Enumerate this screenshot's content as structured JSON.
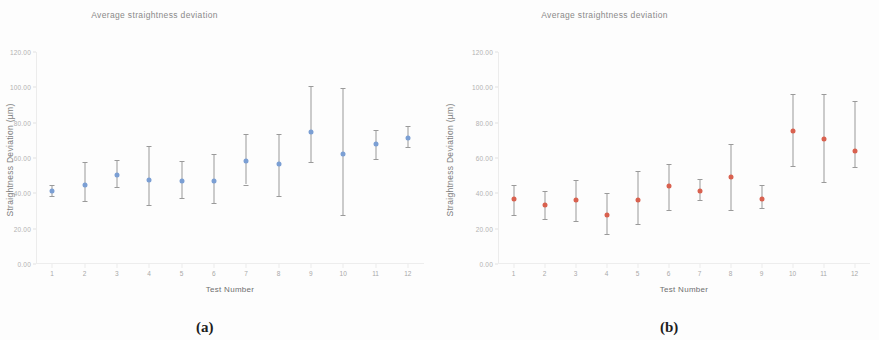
{
  "figure": {
    "panels": [
      {
        "caption": "(a)",
        "title": "Average straightness  deviation",
        "marker_color": "#7b9fd4",
        "whisker_color": "#9a9a9a",
        "chart_data": {
          "type": "scatter",
          "title": "Average straightness  deviation",
          "xlabel": "Test Number",
          "ylabel": "Straightness  Deviation (µm)",
          "categories": [
            "1",
            "2",
            "3",
            "4",
            "5",
            "6",
            "7",
            "8",
            "9",
            "10",
            "11",
            "12"
          ],
          "yticks": [
            "0.00",
            "20.00",
            "40.00",
            "60.00",
            "80.00",
            "100.00",
            "120.00"
          ],
          "ylim": [
            0,
            120
          ],
          "xlim": [
            0.5,
            12.5
          ],
          "grid": false,
          "legend": "none",
          "series": [
            {
              "name": "Average straightness deviation",
              "values": [
                41.5,
                45.0,
                50.5,
                47.5,
                47.0,
                47.0,
                58.5,
                56.5,
                75.0,
                62.0,
                68.0,
                71.5
              ],
              "err_low": [
                38.5,
                35.5,
                43.5,
                33.5,
                37.5,
                34.5,
                45.0,
                38.5,
                57.5,
                28.0,
                59.5,
                66.5
              ],
              "err_high": [
                44.5,
                58.0,
                59.0,
                67.0,
                58.5,
                62.5,
                73.5,
                73.5,
                100.5,
                99.5,
                76.0,
                78.0
              ]
            }
          ]
        }
      },
      {
        "caption": "(b)",
        "title": "Average straightness  deviation",
        "marker_color": "#d9614f",
        "whisker_color": "#9a9a9a",
        "chart_data": {
          "type": "scatter",
          "title": "Average straightness  deviation",
          "xlabel": "Test Number",
          "ylabel": "Straightness  Deviation (µm)",
          "categories": [
            "1",
            "2",
            "3",
            "4",
            "5",
            "6",
            "7",
            "8",
            "9",
            "10",
            "11",
            "12"
          ],
          "yticks": [
            "0.00",
            "20.00",
            "40.00",
            "60.00",
            "80.00",
            "100.00",
            "120.00"
          ],
          "ylim": [
            0,
            120
          ],
          "xlim": [
            0.5,
            12.5
          ],
          "grid": false,
          "legend": "none",
          "series": [
            {
              "name": "Average straightness deviation",
              "values": [
                37.0,
                33.5,
                36.0,
                27.5,
                36.5,
                44.0,
                41.5,
                49.5,
                37.0,
                75.5,
                71.0,
                64.0
              ],
              "err_low": [
                28.0,
                25.5,
                24.5,
                17.0,
                22.5,
                30.5,
                36.0,
                30.5,
                31.5,
                55.5,
                46.5,
                55.0
              ],
              "err_high": [
                45.0,
                41.5,
                47.5,
                40.0,
                52.5,
                56.5,
                48.0,
                68.0,
                44.5,
                96.5,
                96.5,
                92.0
              ]
            }
          ]
        }
      }
    ]
  }
}
